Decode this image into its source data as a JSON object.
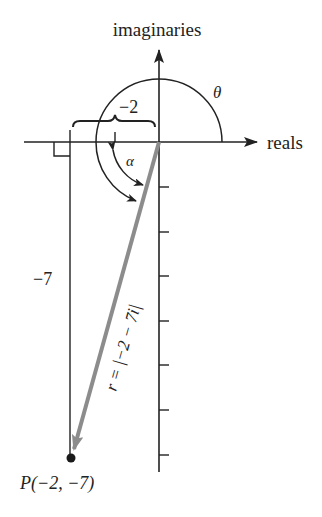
{
  "diagram": {
    "axes": {
      "vertical_label": "imaginaries",
      "horizontal_label": "reals",
      "origin_px": [
        159,
        142
      ],
      "unit_px": 44.5,
      "tick_count_negative_imag": 7
    },
    "labels": {
      "horizontal_measure": "−2",
      "vertical_measure": "−7",
      "theta": "θ",
      "alpha": "α",
      "modulus": "r = |−2 − 7i|",
      "point": "P(−2, −7)"
    },
    "point": {
      "x": -2,
      "y": -7
    },
    "colors": {
      "ink": "#222222",
      "radius_vector": "#8c8c8c",
      "background": "#ffffff"
    }
  }
}
